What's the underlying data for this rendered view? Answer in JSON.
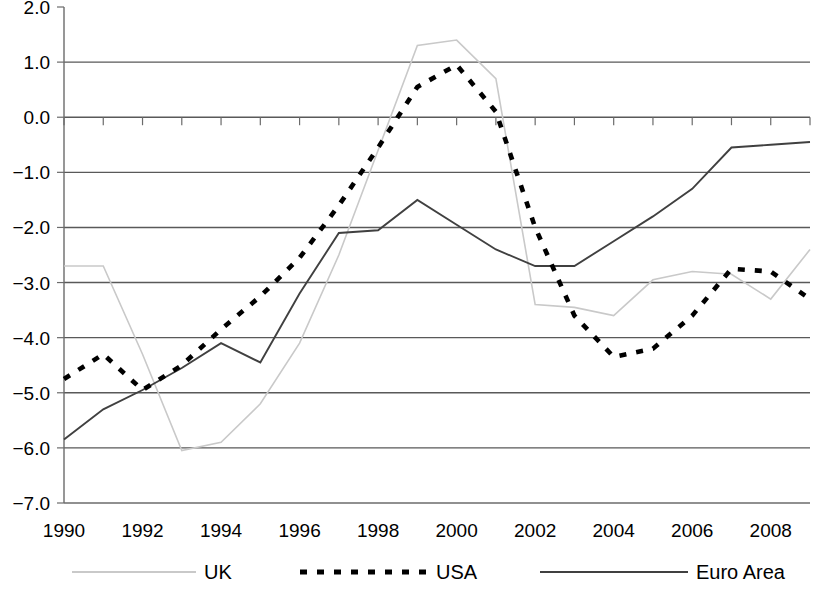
{
  "chart_data": {
    "type": "line",
    "title": "",
    "subtitle": "",
    "xlabel": "",
    "ylabel": "",
    "xlim": [
      1990,
      2009
    ],
    "ylim": [
      -7.0,
      2.0
    ],
    "grid": true,
    "legend_position": "bottom",
    "y_ticks": [
      "2.0",
      "1.0",
      "0.0",
      "-1.0",
      "-2.0",
      "-3.0",
      "-4.0",
      "-5.0",
      "-6.0",
      "-7.0"
    ],
    "y_tick_values": [
      2.0,
      1.0,
      0.0,
      -1.0,
      -2.0,
      -3.0,
      -4.0,
      -5.0,
      -6.0,
      -7.0
    ],
    "x_ticks": [
      "1990",
      "1992",
      "1994",
      "1996",
      "1998",
      "2000",
      "2002",
      "2004",
      "2006",
      "2008"
    ],
    "x_tick_values": [
      1990,
      1992,
      1994,
      1996,
      1998,
      2000,
      2002,
      2004,
      2006,
      2008
    ],
    "x": [
      1990,
      1991,
      1992,
      1993,
      1994,
      1995,
      1996,
      1997,
      1998,
      1999,
      2000,
      2001,
      2002,
      2003,
      2004,
      2005,
      2006,
      2007,
      2008,
      2009
    ],
    "series": [
      {
        "name": "UK",
        "style": "solid-light",
        "color": "#c9c9c9",
        "values": [
          -2.7,
          -2.7,
          -4.3,
          -6.05,
          -5.9,
          -5.2,
          -4.1,
          -2.5,
          -0.6,
          1.3,
          1.4,
          0.7,
          -3.4,
          -3.45,
          -3.6,
          -2.95,
          -2.8,
          -2.85,
          -3.3,
          -2.4
        ]
      },
      {
        "name": "USA",
        "style": "dotted-bold",
        "color": "#000000",
        "values": [
          -4.75,
          -4.3,
          -4.95,
          -4.5,
          -3.85,
          -3.25,
          -2.55,
          -1.6,
          -0.55,
          0.55,
          0.95,
          0.1,
          -2.0,
          -3.6,
          -4.35,
          -4.2,
          -3.6,
          -2.75,
          -2.8,
          -3.3
        ]
      },
      {
        "name": "Euro Area",
        "style": "solid-dark",
        "color": "#404040",
        "values": [
          -5.85,
          -5.3,
          -4.95,
          -4.55,
          -4.1,
          -4.45,
          -3.2,
          -2.1,
          -2.05,
          -1.5,
          -1.95,
          -2.4,
          -2.7,
          -2.7,
          -2.25,
          -1.8,
          -1.3,
          -0.55,
          -0.5,
          -0.45
        ]
      }
    ]
  },
  "legend": {
    "items": [
      {
        "label": "UK",
        "key": "uk"
      },
      {
        "label": "USA",
        "key": "usa"
      },
      {
        "label": "Euro Area",
        "key": "euro"
      }
    ]
  }
}
